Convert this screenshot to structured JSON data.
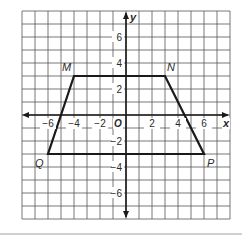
{
  "diagram": {
    "type": "coordinate-plane",
    "grid": {
      "xmin": -8,
      "xmax": 8,
      "ymin": -8,
      "ymax": 8,
      "step": 1
    },
    "axes": {
      "x_label": "x",
      "y_label": "y",
      "origin_label": "O",
      "x_ticks": [
        {
          "value": -6,
          "label": "−6"
        },
        {
          "value": -4,
          "label": "−4"
        },
        {
          "value": -2,
          "label": "−2"
        },
        {
          "value": 2,
          "label": "2"
        },
        {
          "value": 4,
          "label": "4"
        },
        {
          "value": 6,
          "label": "6"
        }
      ],
      "y_ticks": [
        {
          "value": 6,
          "label": "6"
        },
        {
          "value": 4,
          "label": "4"
        },
        {
          "value": 2,
          "label": "2"
        },
        {
          "value": -2,
          "label": "−2"
        },
        {
          "value": -4,
          "label": "−4"
        },
        {
          "value": -6,
          "label": "−6"
        }
      ]
    },
    "shape": {
      "name": "trapezoid MNPQ",
      "vertices": [
        {
          "label": "M",
          "x": -4,
          "y": 3
        },
        {
          "label": "N",
          "x": 3,
          "y": 3
        },
        {
          "label": "P",
          "x": 6,
          "y": -3
        },
        {
          "label": "Q",
          "x": -6,
          "y": -3
        }
      ]
    },
    "colors": {
      "grid": "#555555",
      "axis": "#1a1a1a",
      "shape": "#1a1a1a",
      "divider": "#999999"
    }
  }
}
